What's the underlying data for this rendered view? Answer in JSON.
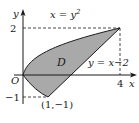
{
  "diagram": {
    "type": "region-between-curves",
    "axes": {
      "x_label": "x",
      "y_label": "y",
      "origin_label": "O",
      "x_ticks": [
        {
          "value": 4,
          "label": "4"
        }
      ],
      "y_ticks": [
        {
          "value": 2,
          "label": "2"
        },
        {
          "value": -1,
          "label": "−1"
        }
      ]
    },
    "curves": [
      {
        "name": "parabola",
        "equation_lhs": "x = y",
        "equation_exp": "2"
      },
      {
        "name": "line",
        "equation": "y = x−2"
      }
    ],
    "region": {
      "label": "D",
      "fill": "#a9a9a9"
    },
    "points": [
      {
        "coords": [
          4,
          2
        ]
      },
      {
        "coords": [
          1,
          -1
        ],
        "label": "(1,−1)"
      }
    ],
    "colors": {
      "stroke": "#1a1a1a",
      "fill": "#a9a9a9"
    }
  }
}
